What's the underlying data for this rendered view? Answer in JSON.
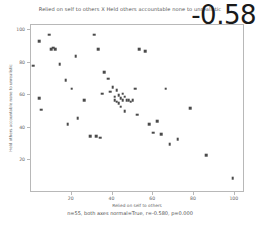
{
  "chart_data": {
    "type": "scatter",
    "title": "Relied on self to others X Held others accountable none to unrealistic",
    "xlabel": "Relied on self to others",
    "ylabel": "Held others accountable none to unrealistic",
    "xlim": [
      0,
      105
    ],
    "ylim": [
      0,
      103
    ],
    "xticks": [
      20,
      40,
      60,
      80,
      100
    ],
    "yticks": [
      20,
      40,
      60,
      80,
      100
    ],
    "xtick_labels": [
      "20",
      "40",
      "60",
      "80",
      "100"
    ],
    "ytick_labels": [
      "20",
      "40",
      "60",
      "80",
      "100"
    ],
    "grid": false,
    "legend": null,
    "annotation": "-0.58",
    "caption": "n=55, both axes normal=True, r=-0.580, p=0.000",
    "n": 55,
    "r": -0.58,
    "p": 0.0,
    "marker_color": "#4a4a4a",
    "points": [
      {
        "x": 1,
        "y": 78
      },
      {
        "x": 4,
        "y": 93
      },
      {
        "x": 4,
        "y": 58
      },
      {
        "x": 5,
        "y": 51
      },
      {
        "x": 9,
        "y": 97
      },
      {
        "x": 10,
        "y": 88
      },
      {
        "x": 11,
        "y": 89
      },
      {
        "x": 12,
        "y": 88
      },
      {
        "x": 14,
        "y": 79
      },
      {
        "x": 17,
        "y": 69
      },
      {
        "x": 18,
        "y": 42
      },
      {
        "x": 20,
        "y": 64
      },
      {
        "x": 22,
        "y": 84
      },
      {
        "x": 23,
        "y": 46
      },
      {
        "x": 26,
        "y": 57
      },
      {
        "x": 29,
        "y": 35
      },
      {
        "x": 31,
        "y": 97
      },
      {
        "x": 32,
        "y": 35
      },
      {
        "x": 33,
        "y": 88
      },
      {
        "x": 34,
        "y": 34
      },
      {
        "x": 35,
        "y": 61
      },
      {
        "x": 36,
        "y": 74
      },
      {
        "x": 38,
        "y": 70
      },
      {
        "x": 39,
        "y": 62
      },
      {
        "x": 40,
        "y": 65
      },
      {
        "x": 41,
        "y": 59
      },
      {
        "x": 41,
        "y": 57
      },
      {
        "x": 42,
        "y": 63
      },
      {
        "x": 42,
        "y": 56
      },
      {
        "x": 43,
        "y": 60
      },
      {
        "x": 43,
        "y": 55
      },
      {
        "x": 44,
        "y": 58
      },
      {
        "x": 44,
        "y": 53
      },
      {
        "x": 45,
        "y": 61
      },
      {
        "x": 45,
        "y": 57
      },
      {
        "x": 46,
        "y": 59
      },
      {
        "x": 46,
        "y": 50
      },
      {
        "x": 47,
        "y": 57
      },
      {
        "x": 48,
        "y": 57
      },
      {
        "x": 49,
        "y": 56
      },
      {
        "x": 50,
        "y": 57
      },
      {
        "x": 51,
        "y": 64
      },
      {
        "x": 52,
        "y": 48
      },
      {
        "x": 53,
        "y": 88
      },
      {
        "x": 56,
        "y": 87
      },
      {
        "x": 58,
        "y": 42
      },
      {
        "x": 60,
        "y": 37
      },
      {
        "x": 62,
        "y": 44
      },
      {
        "x": 64,
        "y": 36
      },
      {
        "x": 66,
        "y": 64
      },
      {
        "x": 68,
        "y": 30
      },
      {
        "x": 72,
        "y": 33
      },
      {
        "x": 78,
        "y": 52
      },
      {
        "x": 86,
        "y": 23
      },
      {
        "x": 99,
        "y": 9
      }
    ]
  }
}
